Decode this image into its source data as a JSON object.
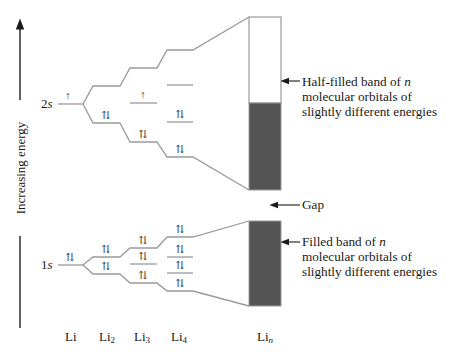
{
  "axis": {
    "label": "Increasing energy"
  },
  "orbital_labels": {
    "upper": "2s",
    "lower": "1s"
  },
  "species": [
    {
      "id": "Li",
      "base": "Li",
      "sub": ""
    },
    {
      "id": "Li2",
      "base": "Li",
      "sub": "2"
    },
    {
      "id": "Li3",
      "base": "Li",
      "sub": "3"
    },
    {
      "id": "Li4",
      "base": "Li",
      "sub": "4"
    },
    {
      "id": "Lin",
      "base": "Li",
      "sub": "n"
    }
  ],
  "electron_symbols": {
    "single": "↑",
    "paired": "⇅"
  },
  "annotations": {
    "half_filled": {
      "line1_prefix": "Half-filled band of ",
      "line1_var": "n",
      "line2": "molecular orbitals of",
      "line3": "slightly different energies"
    },
    "gap": {
      "text": "Gap"
    },
    "filled": {
      "line1_prefix": "Filled band of ",
      "line1_var": "n",
      "line2": "molecular orbitals of",
      "line3": "slightly different energies"
    }
  },
  "colors": {
    "band_fill": "#545454",
    "level_line": "#9a9a9a",
    "text": "#1a1a1a"
  }
}
